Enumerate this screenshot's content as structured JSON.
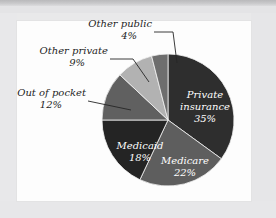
{
  "figure": {
    "title": "",
    "background_color": "#ececec",
    "panel_color": "#fdfdfd"
  },
  "chart_data": {
    "type": "pie",
    "title": "",
    "xlabel": "",
    "ylabel": "",
    "units": "percent",
    "start_angle_deg": 0,
    "direction": "clockwise",
    "legend": "none",
    "grid": false,
    "categories": [
      "Private insurance",
      "Medicare",
      "Medicaid",
      "Out of pocket",
      "Other private",
      "Other public"
    ],
    "values": [
      35,
      22,
      18,
      12,
      9,
      4
    ],
    "value_labels": [
      "35%",
      "22%",
      "18%",
      "12%",
      "9%",
      "4%"
    ],
    "colors": [
      "#2e2e2e",
      "#5e5e5e",
      "#242424",
      "#606060",
      "#b2b2b2",
      "#6e6e6e"
    ],
    "slices": [
      {
        "name": "Private insurance",
        "label_line1": "Private",
        "label_line2": "insurance",
        "value": 35,
        "value_label": "35%",
        "color": "#2e2e2e",
        "label_placement": "inside",
        "label_color": "#ffffff"
      },
      {
        "name": "Medicare",
        "label_line1": "Medicare",
        "label_line2": "",
        "value": 22,
        "value_label": "22%",
        "color": "#5e5e5e",
        "label_placement": "inside",
        "label_color": "#ffffff"
      },
      {
        "name": "Medicaid",
        "label_line1": "Medicaid",
        "label_line2": "",
        "value": 18,
        "value_label": "18%",
        "color": "#242424",
        "label_placement": "inside",
        "label_color": "#ffffff"
      },
      {
        "name": "Out of pocket",
        "label_line1": "Out of pocket",
        "label_line2": "",
        "value": 12,
        "value_label": "12%",
        "color": "#606060",
        "label_placement": "outside-left",
        "label_color": "#1d1d1d"
      },
      {
        "name": "Other private",
        "label_line1": "Other private",
        "label_line2": "",
        "value": 9,
        "value_label": "9%",
        "color": "#b2b2b2",
        "label_placement": "outside-left",
        "label_color": "#1d1d1d"
      },
      {
        "name": "Other public",
        "label_line1": "Other public",
        "label_line2": "",
        "value": 4,
        "value_label": "4%",
        "color": "#6e6e6e",
        "label_placement": "outside-top",
        "label_color": "#1d1d1d"
      }
    ]
  }
}
